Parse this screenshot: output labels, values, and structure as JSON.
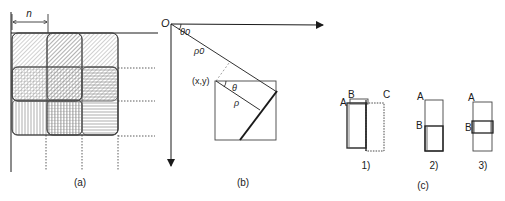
{
  "panels": {
    "a": {
      "caption": "(a)",
      "dimension_label": "n"
    },
    "b": {
      "caption": "(b)",
      "origin_label": "O",
      "theta0_label": "θ0",
      "rho0_label": "ρ0",
      "point_label": "(x,y)",
      "theta_label": "θ",
      "rho_label": "ρ"
    },
    "c": {
      "caption": "(c)",
      "sub1": {
        "caption": "1)",
        "labels": [
          "A",
          "B",
          "C"
        ]
      },
      "sub2": {
        "caption": "2)",
        "labels": [
          "A",
          "B"
        ]
      },
      "sub3": {
        "caption": "3)",
        "labels": [
          "A",
          "B"
        ]
      }
    }
  },
  "colors": {
    "line": "#1a1a1a",
    "hatch": "#8a8a8a",
    "fill": "#eeeeee"
  }
}
